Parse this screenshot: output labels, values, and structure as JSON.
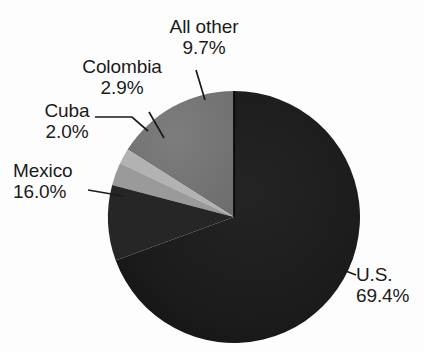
{
  "chart_data": {
    "type": "pie",
    "title": "",
    "subtitle": "",
    "xlabel": "",
    "ylabel": "",
    "legend_position": "none",
    "grid": false,
    "labels_outside_with_leader_lines": true,
    "start_angle_deg_from_12_oclock": 0,
    "direction": "clockwise",
    "categories": [
      "U.S.",
      "All other",
      "Colombia",
      "Cuba",
      "Mexico"
    ],
    "values": [
      69.4,
      9.7,
      2.9,
      2.0,
      16.0
    ],
    "value_suffix": "%",
    "slices": [
      {
        "name": "U.S.",
        "value": 69.4,
        "value_text": "69.4%",
        "color": "#1a1a1a"
      },
      {
        "name": "All other",
        "value": 9.7,
        "value_text": "9.7%",
        "color": "#2a2a2a"
      },
      {
        "name": "Colombia",
        "value": 2.9,
        "value_text": "2.9%",
        "color": "#9a9a9a"
      },
      {
        "name": "Cuba",
        "value": 2.0,
        "value_text": "2.0%",
        "color": "#b2b2b2"
      },
      {
        "name": "Mexico",
        "value": 16.0,
        "value_text": "16.0%",
        "color": "#737373"
      }
    ]
  },
  "labels": {
    "all_other": {
      "name": "All other",
      "pct": "9.7%"
    },
    "colombia": {
      "name": "Colombia",
      "pct": "2.9%"
    },
    "cuba": {
      "name": "Cuba",
      "pct": "2.0%"
    },
    "mexico": {
      "name": "Mexico",
      "pct": "16.0%"
    },
    "us": {
      "name": "U.S.",
      "pct": "69.4%"
    }
  },
  "colors": {
    "background": "#fdfdfd",
    "text": "#1b1b1b",
    "leader_line": "#1b1b1b",
    "slice_divider": "#000000",
    "us": "#1a1a1a",
    "all_other": "#2a2a2a",
    "colombia": "#9a9a9a",
    "cuba": "#b2b2b2",
    "mexico": "#737373"
  }
}
